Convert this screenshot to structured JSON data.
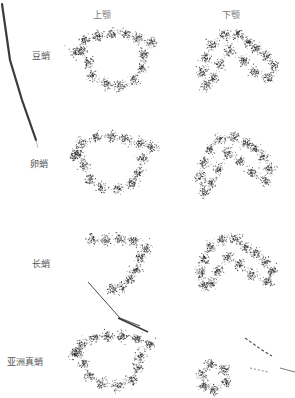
{
  "figure": {
    "columns": [
      {
        "label": "上颚",
        "x": 93
      },
      {
        "label": "下颚",
        "x": 222
      }
    ],
    "rows": [
      {
        "label": "短蛸",
        "display": "豆蛸",
        "label_x": 32,
        "label_y": 49
      },
      {
        "label": "卵蛸",
        "display": "卵蛸",
        "label_x": 30,
        "label_y": 157
      },
      {
        "label": "长蛸",
        "display": "长蛸",
        "label_x": 32,
        "label_y": 257
      },
      {
        "label": "亚洲真蛸",
        "display": "亚洲真蛸",
        "label_x": 7,
        "label_y": 355
      }
    ],
    "point_color": "#2a2a2a",
    "artifact_color": "#3a3a3a"
  },
  "panels": [
    {
      "row": 0,
      "col": 0,
      "left": 62,
      "top": 20,
      "clusters": [
        [
          14,
          32
        ],
        [
          22,
          20
        ],
        [
          36,
          16
        ],
        [
          50,
          14
        ],
        [
          64,
          14
        ],
        [
          76,
          18
        ],
        [
          90,
          22
        ],
        [
          82,
          34
        ],
        [
          80,
          48
        ],
        [
          72,
          60
        ],
        [
          58,
          66
        ],
        [
          44,
          64
        ],
        [
          30,
          56
        ],
        [
          26,
          42
        ],
        [
          20,
          30
        ]
      ]
    },
    {
      "row": 0,
      "col": 1,
      "left": 190,
      "top": 20,
      "clusters": [
        [
          16,
          66
        ],
        [
          12,
          52
        ],
        [
          16,
          38
        ],
        [
          22,
          24
        ],
        [
          34,
          14
        ],
        [
          48,
          14
        ],
        [
          58,
          22
        ],
        [
          66,
          28
        ],
        [
          76,
          36
        ],
        [
          84,
          46
        ],
        [
          78,
          58
        ],
        [
          64,
          52
        ],
        [
          54,
          40
        ],
        [
          40,
          30
        ],
        [
          30,
          44
        ],
        [
          24,
          58
        ]
      ]
    },
    {
      "row": 1,
      "col": 0,
      "left": 62,
      "top": 125,
      "clusters": [
        [
          12,
          30
        ],
        [
          20,
          18
        ],
        [
          34,
          12
        ],
        [
          50,
          12
        ],
        [
          64,
          14
        ],
        [
          78,
          18
        ],
        [
          90,
          22
        ],
        [
          80,
          34
        ],
        [
          76,
          48
        ],
        [
          70,
          58
        ],
        [
          56,
          64
        ],
        [
          40,
          62
        ],
        [
          28,
          54
        ],
        [
          22,
          40
        ],
        [
          16,
          28
        ]
      ]
    },
    {
      "row": 1,
      "col": 1,
      "left": 190,
      "top": 125,
      "clusters": [
        [
          14,
          66
        ],
        [
          10,
          52
        ],
        [
          14,
          38
        ],
        [
          20,
          24
        ],
        [
          30,
          14
        ],
        [
          44,
          12
        ],
        [
          56,
          18
        ],
        [
          66,
          24
        ],
        [
          74,
          32
        ],
        [
          80,
          44
        ],
        [
          76,
          56
        ],
        [
          62,
          48
        ],
        [
          50,
          36
        ],
        [
          38,
          28
        ],
        [
          28,
          44
        ],
        [
          22,
          58
        ]
      ]
    },
    {
      "row": 2,
      "col": 0,
      "left": 62,
      "top": 225,
      "clusters": [
        [
          30,
          14
        ],
        [
          44,
          16
        ],
        [
          58,
          14
        ],
        [
          72,
          16
        ],
        [
          84,
          22
        ],
        [
          78,
          32
        ],
        [
          74,
          44
        ],
        [
          68,
          54
        ],
        [
          60,
          62
        ],
        [
          50,
          64
        ]
      ]
    },
    {
      "row": 2,
      "col": 1,
      "left": 190,
      "top": 225,
      "clusters": [
        [
          14,
          60
        ],
        [
          10,
          48
        ],
        [
          14,
          34
        ],
        [
          20,
          22
        ],
        [
          32,
          14
        ],
        [
          46,
          14
        ],
        [
          56,
          22
        ],
        [
          66,
          28
        ],
        [
          76,
          36
        ],
        [
          82,
          46
        ],
        [
          78,
          56
        ],
        [
          62,
          50
        ],
        [
          50,
          40
        ],
        [
          38,
          32
        ],
        [
          28,
          46
        ],
        [
          22,
          58
        ]
      ]
    },
    {
      "row": 3,
      "col": 0,
      "left": 62,
      "top": 320,
      "clusters": [
        [
          12,
          34
        ],
        [
          20,
          24
        ],
        [
          32,
          18
        ],
        [
          46,
          16
        ],
        [
          60,
          16
        ],
        [
          74,
          18
        ],
        [
          88,
          24
        ],
        [
          78,
          36
        ],
        [
          76,
          48
        ],
        [
          70,
          60
        ],
        [
          56,
          66
        ],
        [
          40,
          64
        ],
        [
          28,
          56
        ],
        [
          22,
          44
        ],
        [
          16,
          32
        ]
      ]
    },
    {
      "row": 3,
      "col": 1,
      "left": 190,
      "top": 320,
      "clusters": [
        [
          12,
          54
        ],
        [
          14,
          66
        ],
        [
          24,
          70
        ],
        [
          36,
          62
        ],
        [
          34,
          50
        ],
        [
          20,
          44
        ]
      ]
    }
  ]
}
